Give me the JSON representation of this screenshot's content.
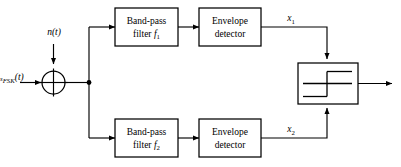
{
  "diagram": {
    "colors": {
      "stroke": "#000000",
      "background": "#ffffff",
      "fill": "#ffffff"
    },
    "inputs": {
      "signal_label_main": "s",
      "signal_label_sub": "FSK",
      "signal_label_arg": "(t)",
      "noise_label": "n(t)"
    },
    "summing_junction": {
      "name": "adder",
      "symbol": "cross-circle"
    },
    "branches": [
      {
        "id": "upper",
        "filter": {
          "line1": "Band-pass",
          "line2_prefix": "filter ",
          "line2_var": "f",
          "line2_sub": "1"
        },
        "detector": {
          "line1": "Envelope",
          "line2": "detector"
        },
        "output_label_var": "x",
        "output_label_sub": "1"
      },
      {
        "id": "lower",
        "filter": {
          "line1": "Band-pass",
          "line2_prefix": "filter ",
          "line2_var": "f",
          "line2_sub": "2"
        },
        "detector": {
          "line1": "Envelope",
          "line2": "detector"
        },
        "output_label_var": "x",
        "output_label_sub": "2"
      }
    ],
    "comparator": {
      "name": "decision-device",
      "symbol": "step-hysteresis"
    },
    "output": {
      "label": ""
    }
  }
}
